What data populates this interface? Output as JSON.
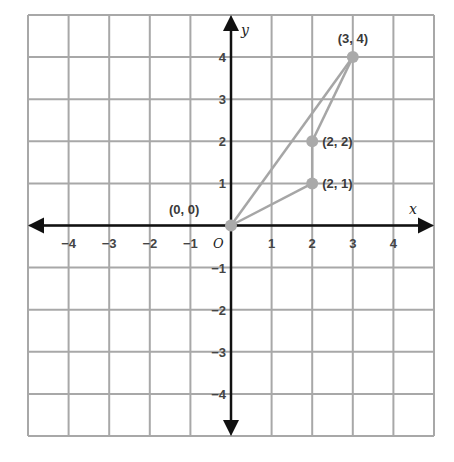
{
  "chart_data": {
    "type": "scatter",
    "title": "",
    "xlabel": "x",
    "ylabel": "y",
    "xlim": [
      -5,
      5
    ],
    "ylim": [
      -5,
      5
    ],
    "grid": true,
    "origin_label": "O",
    "x_ticks": [
      -4,
      -3,
      -2,
      -1,
      1,
      2,
      3,
      4
    ],
    "y_ticks": [
      4,
      3,
      2,
      1,
      -1,
      -2,
      -3,
      -4
    ],
    "points": [
      {
        "x": 0,
        "y": 0,
        "label": "(0, 0)"
      },
      {
        "x": 2,
        "y": 1,
        "label": "(2, 1)"
      },
      {
        "x": 2,
        "y": 2,
        "label": "(2, 2)"
      },
      {
        "x": 3,
        "y": 4,
        "label": "(3, 4)"
      }
    ],
    "segments": [
      {
        "from": [
          0,
          0
        ],
        "to": [
          3,
          4
        ]
      },
      {
        "from": [
          0,
          0
        ],
        "to": [
          2,
          1
        ]
      },
      {
        "from": [
          2,
          1
        ],
        "to": [
          2,
          2
        ]
      },
      {
        "from": [
          2,
          2
        ],
        "to": [
          3,
          4
        ]
      }
    ],
    "colors": {
      "grid": "#a8a8a8",
      "axis": "#111111",
      "point": "#aaaaaa",
      "segment": "#a6a6a6"
    }
  }
}
